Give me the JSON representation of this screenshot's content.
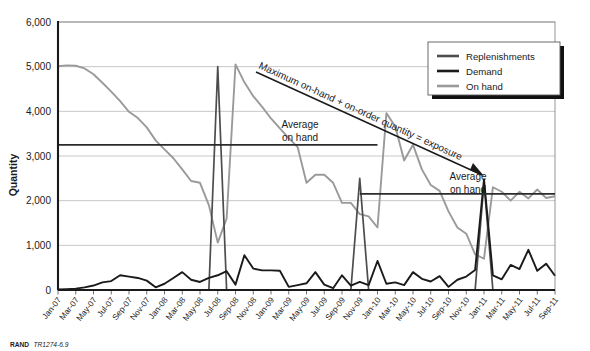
{
  "figure": {
    "credit_prefix": "RAND",
    "credit_id": "TR1274-6.9"
  },
  "annotations": {
    "exposure": "Maximum on-hand + on-order quantity = exposure",
    "average_on_hand_1_line1": "Average",
    "average_on_hand_1_line2": "on hand",
    "average_on_hand_2_line1": "Average",
    "average_on_hand_2_line2": "on hand"
  },
  "colors": {
    "replenishments": "#4d4d4d",
    "demand": "#1a1a1a",
    "on_hand": "#9a9a9a",
    "average_line": "#2b2b2b",
    "grid": "#b9b9b9",
    "axis": "#1a1a1a"
  },
  "chart_data": {
    "type": "line",
    "title": "",
    "xlabel": "",
    "ylabel": "Quantity",
    "ylim": [
      0,
      6000
    ],
    "ytick_labels": [
      "0",
      "1,000",
      "2,000",
      "3,000",
      "4,000",
      "5,000",
      "6,000"
    ],
    "ytick_values": [
      0,
      1000,
      2000,
      3000,
      4000,
      5000,
      6000
    ],
    "grid": true,
    "legend_position": "top-right",
    "xtick_labels": [
      "Jan-07",
      "Mar-07",
      "May-07",
      "Jul-07",
      "Sep-07",
      "Nov-07",
      "Jan-08",
      "Mar-08",
      "May-08",
      "Jul-08",
      "Sep-08",
      "Nov-08",
      "Jan-09",
      "Mar-09",
      "May-09",
      "Jul-09",
      "Sep-09",
      "Nov-09",
      "Jan-10",
      "Mar-10",
      "May-10",
      "Jul-10",
      "Sep-10",
      "Nov-10",
      "Jan-11",
      "Mar-11",
      "May-11",
      "Jul-11",
      "Sep-11"
    ],
    "x_months": [
      "Jan-07",
      "Feb-07",
      "Mar-07",
      "Apr-07",
      "May-07",
      "Jun-07",
      "Jul-07",
      "Aug-07",
      "Sep-07",
      "Oct-07",
      "Nov-07",
      "Dec-07",
      "Jan-08",
      "Feb-08",
      "Mar-08",
      "Apr-08",
      "May-08",
      "Jun-08",
      "Jul-08",
      "Aug-08",
      "Sep-08",
      "Oct-08",
      "Nov-08",
      "Dec-08",
      "Jan-09",
      "Feb-09",
      "Mar-09",
      "Apr-09",
      "May-09",
      "Jun-09",
      "Jul-09",
      "Aug-09",
      "Sep-09",
      "Oct-09",
      "Nov-09",
      "Dec-09",
      "Jan-10",
      "Feb-10",
      "Mar-10",
      "Apr-10",
      "May-10",
      "Jun-10",
      "Jul-10",
      "Aug-10",
      "Sep-10",
      "Oct-10",
      "Nov-10",
      "Dec-10",
      "Jan-11",
      "Feb-11",
      "Mar-11",
      "Apr-11",
      "May-11",
      "Jun-11",
      "Jul-11",
      "Aug-11",
      "Sep-11"
    ],
    "series": [
      {
        "name": "Replenishments",
        "color": "#4d4d4d",
        "values": [
          0,
          0,
          0,
          0,
          0,
          0,
          0,
          0,
          0,
          0,
          0,
          0,
          0,
          0,
          0,
          0,
          0,
          0,
          5000,
          0,
          0,
          0,
          0,
          0,
          0,
          0,
          0,
          0,
          0,
          0,
          0,
          0,
          0,
          0,
          2500,
          0,
          0,
          0,
          0,
          0,
          0,
          0,
          0,
          0,
          0,
          0,
          0,
          0,
          2400,
          0,
          0,
          0,
          0,
          0,
          0,
          0,
          0
        ]
      },
      {
        "name": "Demand",
        "color": "#1a1a1a",
        "values": [
          10,
          20,
          30,
          60,
          100,
          170,
          200,
          330,
          300,
          270,
          210,
          60,
          140,
          270,
          400,
          230,
          180,
          270,
          330,
          420,
          120,
          780,
          480,
          440,
          440,
          430,
          70,
          110,
          150,
          400,
          120,
          40,
          330,
          100,
          180,
          110,
          650,
          140,
          170,
          110,
          400,
          250,
          190,
          310,
          70,
          230,
          300,
          450,
          2480,
          330,
          240,
          560,
          470,
          900,
          430,
          590,
          320
        ]
      },
      {
        "name": "On hand",
        "color": "#9a9a9a",
        "values": [
          5010,
          5030,
          5020,
          4960,
          4830,
          4640,
          4440,
          4230,
          3990,
          3850,
          3640,
          3350,
          3150,
          2950,
          2700,
          2440,
          2400,
          1900,
          1060,
          1600,
          5050,
          4650,
          4340,
          4100,
          3840,
          3620,
          3400,
          3200,
          2400,
          2580,
          2580,
          2400,
          1950,
          1950,
          1700,
          1650,
          1400,
          3960,
          3660,
          2900,
          3250,
          2700,
          2350,
          2220,
          1760,
          1400,
          1260,
          800,
          700,
          2300,
          2200,
          2000,
          2200,
          2050,
          2250,
          2060,
          2100
        ]
      }
    ],
    "reference_lines": [
      {
        "label": "Average on hand",
        "value": 3250,
        "from_month": "Jan-07",
        "to_month": "Jan-10"
      },
      {
        "label": "Average on hand",
        "value": 2150,
        "from_month": "Nov-09",
        "to_month": "Sep-11"
      }
    ]
  },
  "legend": {
    "items": [
      {
        "label": "Replenishments",
        "color": "#4d4d4d"
      },
      {
        "label": "Demand",
        "color": "#1a1a1a"
      },
      {
        "label": "On hand",
        "color": "#9a9a9a"
      }
    ]
  }
}
